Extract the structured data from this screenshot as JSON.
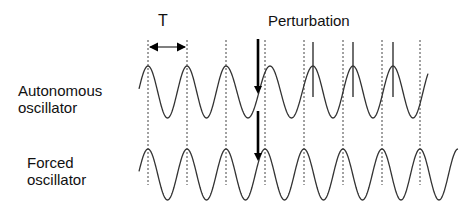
{
  "labels": {
    "period": "T",
    "perturbation": "Perturbation",
    "autonomous_line1": "Autonomous",
    "autonomous_line2": "oscillator",
    "forced_line1": "Forced",
    "forced_line2": "oscillator"
  },
  "diagram": {
    "period_px": 39,
    "reference_dotted_lines_x": [
      148,
      187,
      226,
      265,
      304,
      343,
      382,
      420
    ],
    "autonomous_wave": {
      "peak_y": 66,
      "trough_y": 118,
      "start_x": 139,
      "end_x": 428,
      "peaks_before_perturbation_x": [
        148,
        187,
        226
      ],
      "peaks_after_perturbation_x": [
        270,
        313,
        353,
        393
      ],
      "phase_marker_ticks_x": [
        313,
        353,
        393
      ]
    },
    "forced_wave": {
      "peak_y": 149,
      "trough_y": 200,
      "start_x": 139,
      "end_x": 458,
      "peaks_x": [
        148,
        187,
        226,
        265,
        304,
        343,
        382,
        420
      ]
    },
    "perturbation_arrows_x": 258,
    "colors": {
      "wave": "#333333",
      "dotted": "#444444",
      "arrow": "#000000"
    }
  }
}
